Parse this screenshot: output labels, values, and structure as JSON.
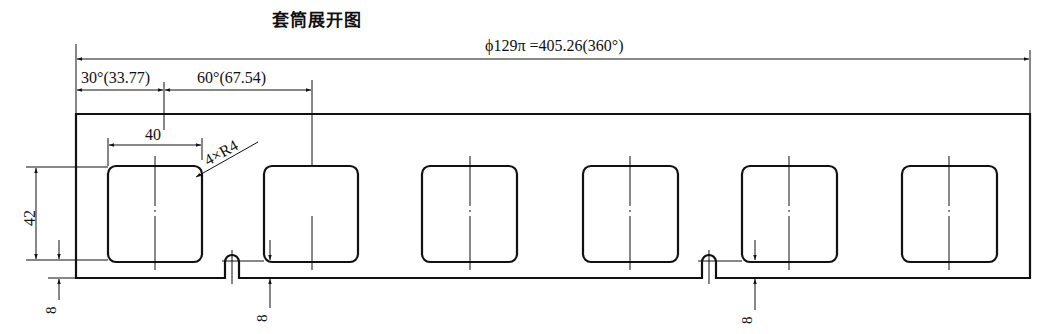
{
  "title": "套筒展开图",
  "dimensions": {
    "overall": "ϕ129π =405.26(360°)",
    "first_offset": "30°(33.77)",
    "pitch": "60°(67.54)",
    "window_width": "40",
    "window_height": "42",
    "corner_radius": "4×R4",
    "bottom_gap_1": "8",
    "bottom_gap_2": "8",
    "bottom_gap_3": "8"
  },
  "windows": [
    {
      "x": 108,
      "cx": 155
    },
    {
      "x": 264,
      "cx": 312
    },
    {
      "x": 422,
      "cx": 470
    },
    {
      "x": 583,
      "cx": 630
    },
    {
      "x": 742,
      "cx": 789
    },
    {
      "x": 902,
      "cx": 949
    }
  ],
  "slots": [
    {
      "cx": 232
    },
    {
      "cx": 709
    }
  ]
}
